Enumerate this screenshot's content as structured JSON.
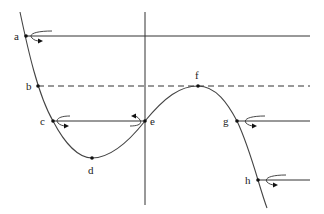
{
  "diagram": {
    "points": [
      {
        "label": "a",
        "x": 26,
        "y": 36
      },
      {
        "label": "b",
        "x": 38,
        "y": 86
      },
      {
        "label": "c",
        "x": 53,
        "y": 121
      },
      {
        "label": "d",
        "x": 92,
        "y": 158
      },
      {
        "label": "e",
        "x": 145,
        "y": 121
      },
      {
        "label": "f",
        "x": 198,
        "y": 86
      },
      {
        "label": "g",
        "x": 237,
        "y": 121
      },
      {
        "label": "h",
        "x": 258,
        "y": 180
      }
    ],
    "lines": [
      {
        "from": "a",
        "style": "solid",
        "to_x": 310
      },
      {
        "from": "b",
        "style": "dashed",
        "to_x": 310
      },
      {
        "from": "c",
        "style": "solid",
        "to": "e"
      },
      {
        "from": "g",
        "style": "solid",
        "to_x": 310
      },
      {
        "from": "h",
        "style": "solid",
        "to_x": 310
      }
    ],
    "curled_arrows_at": [
      "a",
      "c",
      "e",
      "g",
      "h"
    ]
  }
}
